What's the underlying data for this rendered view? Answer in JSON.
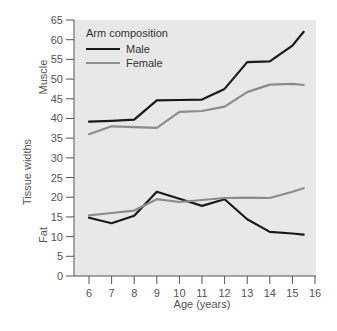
{
  "chart_data": {
    "type": "line",
    "title": "",
    "xlabel": "Age (years)",
    "ylabel": "Tissue widths",
    "ylabel_sections": [
      "Muscle",
      "Fat"
    ],
    "xlim": [
      5.3,
      16
    ],
    "ylim": [
      0,
      65
    ],
    "xticks": [
      6,
      7,
      8,
      9,
      10,
      11,
      12,
      13,
      14,
      15,
      16
    ],
    "yticks": [
      0,
      5,
      10,
      15,
      20,
      25,
      30,
      35,
      40,
      45,
      50,
      55,
      60,
      65
    ],
    "grid": false,
    "legend": {
      "title": "Arm composition",
      "position": "upper-left",
      "entries": [
        "Male",
        "Female"
      ]
    },
    "x": [
      6,
      7,
      8,
      9,
      10,
      11,
      12,
      13,
      14,
      15,
      15.5
    ],
    "series": [
      {
        "name": "Male",
        "group": "Muscle",
        "color": "#1a1a1a",
        "values": [
          39.2,
          39.4,
          39.7,
          44.6,
          44.7,
          44.8,
          47.5,
          54.3,
          54.5,
          58.5,
          62.0
        ]
      },
      {
        "name": "Female",
        "group": "Muscle",
        "color": "#8c8c8c",
        "values": [
          36.0,
          38.0,
          37.8,
          37.6,
          41.7,
          41.9,
          43.0,
          46.7,
          48.6,
          48.8,
          48.5
        ]
      },
      {
        "name": "Male",
        "group": "Fat",
        "color": "#1a1a1a",
        "values": [
          14.8,
          13.4,
          15.3,
          21.4,
          19.6,
          17.8,
          19.5,
          14.4,
          11.2,
          10.8,
          10.5
        ]
      },
      {
        "name": "Female",
        "group": "Fat",
        "color": "#8c8c8c",
        "values": [
          15.4,
          16.0,
          16.6,
          19.5,
          18.8,
          19.3,
          19.8,
          19.9,
          19.8,
          21.4,
          22.3
        ]
      }
    ]
  },
  "style": {
    "plot_background": "#e8e8e8",
    "axis_color": "#555555",
    "text_color": "#555555"
  }
}
